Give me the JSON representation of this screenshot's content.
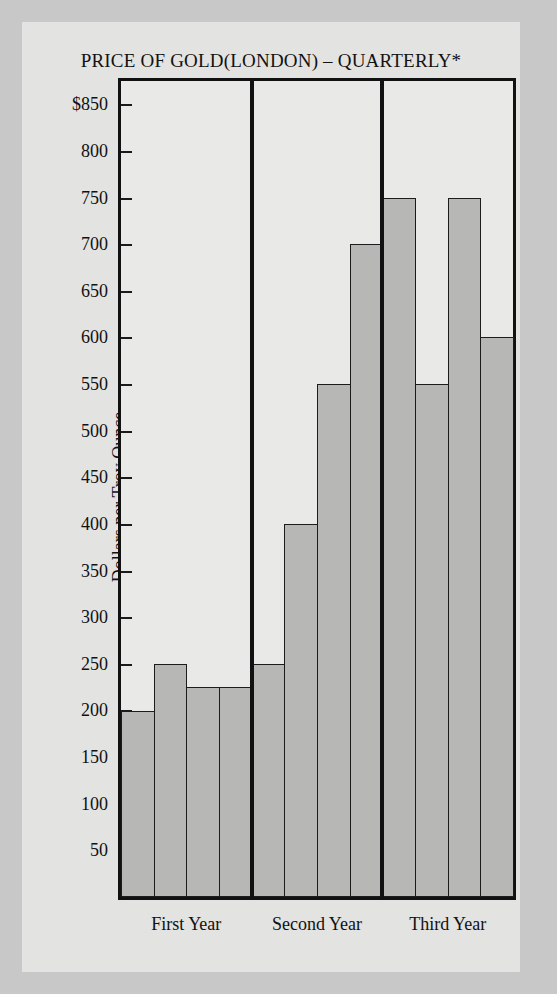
{
  "chart_data": {
    "type": "bar",
    "title": "PRICE OF GOLD(LONDON) – QUARTERLY*",
    "xlabel": "",
    "ylabel": "Dollars per Troy Ounce",
    "ylim": [
      0,
      875
    ],
    "grid": false,
    "legend": "none",
    "axis_ticks": [
      {
        "value": 850,
        "label": "$850"
      },
      {
        "value": 800,
        "label": "800"
      },
      {
        "value": 750,
        "label": "750"
      },
      {
        "value": 700,
        "label": "700"
      },
      {
        "value": 650,
        "label": "650"
      },
      {
        "value": 600,
        "label": "600"
      },
      {
        "value": 550,
        "label": "550"
      },
      {
        "value": 500,
        "label": "500"
      },
      {
        "value": 450,
        "label": "450"
      },
      {
        "value": 400,
        "label": "400"
      },
      {
        "value": 350,
        "label": "350"
      },
      {
        "value": 300,
        "label": "300"
      },
      {
        "value": 250,
        "label": "250"
      },
      {
        "value": 200,
        "label": "200"
      },
      {
        "value": 150,
        "label": "150"
      },
      {
        "value": 100,
        "label": "100"
      },
      {
        "value": 50,
        "label": "50"
      }
    ],
    "categories": [
      "Q1",
      "Q2",
      "Q3",
      "Q4",
      "Q1",
      "Q2",
      "Q3",
      "Q4",
      "Q1",
      "Q2",
      "Q3",
      "Q4"
    ],
    "values": [
      200,
      250,
      225,
      225,
      250,
      400,
      550,
      700,
      750,
      550,
      750,
      600
    ],
    "groups": [
      {
        "label": "First Year",
        "values": [
          200,
          250,
          225,
          225
        ]
      },
      {
        "label": "Second Year",
        "values": [
          250,
          400,
          550,
          700
        ]
      },
      {
        "label": "Third Year",
        "values": [
          750,
          550,
          750,
          600
        ]
      }
    ],
    "bar_color": "#b7b7b5",
    "bar_edge_color": "#1c1c1c",
    "plot_background": "#e9e9e7",
    "figure_background": "#e3e3e1",
    "page_background": "#c8c8c8"
  }
}
